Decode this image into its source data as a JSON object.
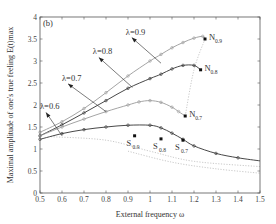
{
  "chart_data": {
    "type": "line",
    "panel_label": "(b)",
    "title": "",
    "xlabel": "External frequency ω",
    "ylabel": "Maximal amplitude of one's true feeling  E(t)max",
    "xlim": [
      0.5,
      1.5
    ],
    "ylim": [
      0,
      4
    ],
    "xticks": [
      "0.5",
      "0.6",
      "0.7",
      "0.8",
      "0.9",
      "1",
      "1.1",
      "1.2",
      "1.3",
      "1.4",
      "1.5"
    ],
    "yticks": [
      "0",
      "0.5",
      "1",
      "1.5",
      "2",
      "2.5",
      "3",
      "3.5",
      "4"
    ],
    "grid": false,
    "series": [
      {
        "name": "λ=0.9",
        "color": "#9a9a9a",
        "style": "solid-circles",
        "x": [
          0.5,
          0.6,
          0.7,
          0.8,
          0.9,
          1.0,
          1.05,
          1.1,
          1.15,
          1.2,
          1.24,
          1.25
        ],
        "y": [
          1.38,
          1.62,
          1.92,
          2.28,
          2.66,
          3.0,
          3.15,
          3.3,
          3.42,
          3.52,
          3.56,
          3.5
        ]
      },
      {
        "name": "λ=0.8",
        "color": "#333333",
        "style": "solid-circles",
        "x": [
          0.5,
          0.6,
          0.7,
          0.8,
          0.9,
          1.0,
          1.05,
          1.1,
          1.15,
          1.2,
          1.23
        ],
        "y": [
          1.3,
          1.55,
          1.82,
          2.1,
          2.38,
          2.6,
          2.7,
          2.82,
          2.9,
          2.9,
          2.8
        ]
      },
      {
        "name": "λ=0.7",
        "color": "#9a9a9a",
        "style": "solid-circles",
        "x": [
          0.5,
          0.6,
          0.7,
          0.8,
          0.9,
          0.95,
          1.0,
          1.05,
          1.1,
          1.13,
          1.16
        ],
        "y": [
          1.3,
          1.5,
          1.68,
          1.85,
          2.0,
          2.07,
          2.1,
          2.06,
          1.95,
          1.85,
          1.75
        ]
      },
      {
        "name": "λ=0.6",
        "color": "#333333",
        "style": "solid-circles",
        "x": [
          0.5,
          0.6,
          0.7,
          0.8,
          0.9,
          1.0,
          1.05,
          1.1,
          1.15,
          1.2,
          1.3,
          1.4,
          1.5
        ],
        "y": [
          1.22,
          1.35,
          1.44,
          1.5,
          1.54,
          1.54,
          1.48,
          1.36,
          1.22,
          1.07,
          0.9,
          0.8,
          0.73
        ]
      }
    ],
    "dotted_curves": [
      {
        "name": "N-locus",
        "x": [
          1.16,
          1.2,
          1.25
        ],
        "y": [
          1.75,
          2.8,
          3.5
        ]
      },
      {
        "name": "S-locus-1",
        "x": [
          0.55,
          0.8,
          1.0,
          1.2,
          1.5
        ],
        "y": [
          1.28,
          1.2,
          0.95,
          0.72,
          0.6
        ]
      },
      {
        "name": "S-locus-2",
        "x": [
          0.9,
          1.1,
          1.3,
          1.5
        ],
        "y": [
          0.95,
          0.7,
          0.55,
          0.45
        ]
      }
    ],
    "points": [
      {
        "label": "N",
        "sub": "0.9",
        "x": 1.25,
        "y": 3.5
      },
      {
        "label": "N",
        "sub": "0.8",
        "x": 1.23,
        "y": 2.8
      },
      {
        "label": "N",
        "sub": "0.7",
        "x": 1.16,
        "y": 1.75
      },
      {
        "label": "S",
        "sub": "0.9",
        "x": 0.93,
        "y": 1.3
      },
      {
        "label": "S",
        "sub": "0.8",
        "x": 1.05,
        "y": 1.23
      },
      {
        "label": "S",
        "sub": "0.7",
        "x": 1.15,
        "y": 1.2
      }
    ],
    "annotations": [
      {
        "text": "λ=0.9",
        "x": 0.89,
        "y": 3.6
      },
      {
        "text": "λ=0.8",
        "x": 0.74,
        "y": 3.15
      },
      {
        "text": "λ=0.7",
        "x": 0.6,
        "y": 2.55
      },
      {
        "text": "λ=0.6",
        "x": 0.5,
        "y": 1.9
      }
    ]
  }
}
